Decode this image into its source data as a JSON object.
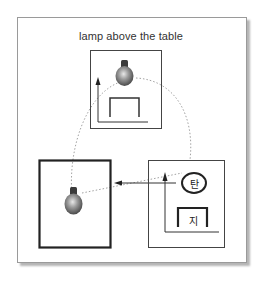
{
  "diagram": {
    "title": "lamp above the table",
    "panels": [
      {
        "id": "top",
        "description": "lamp above the table scene",
        "objects": [
          "lamp",
          "table",
          "vertical-axis-arrow"
        ]
      },
      {
        "id": "left",
        "description": "bold frame with lamp",
        "objects": [
          "lamp"
        ]
      },
      {
        "id": "right",
        "description": "symbolic scene",
        "objects": [
          "circle-label",
          "table-label",
          "vertical-axis-arrow"
        ]
      }
    ],
    "labels": {
      "circle_label": "탄",
      "table_label": "지"
    },
    "arrows": [
      {
        "from": "right-panel",
        "to": "left-panel",
        "style": "solid"
      }
    ],
    "dotted_paths": [
      {
        "from": "left-lamp",
        "to": "top-lamp",
        "style": "dotted-arc"
      },
      {
        "from": "top-lamp",
        "to": "right-panel",
        "style": "dotted-arc"
      },
      {
        "from": "left-lamp",
        "to": "right-circle",
        "style": "dotted-line"
      }
    ],
    "colors": {
      "frame_border": "#9a9a9a",
      "line": "#333333",
      "dotted": "#8a8a8a",
      "lamp_body": "#7a7a7a",
      "lamp_base": "#3a3a3a"
    }
  }
}
